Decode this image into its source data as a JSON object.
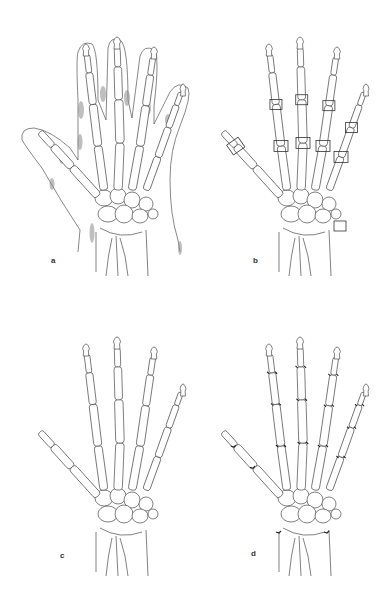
{
  "figure": {
    "panels": [
      {
        "id": "a",
        "label": "a",
        "label_pos": [
          51,
          257
        ],
        "variant": "soft-tissue-outline",
        "description": "Hand skeleton with soft tissue outline and shaded swelling regions"
      },
      {
        "id": "b",
        "label": "b",
        "label_pos": [
          253,
          257
        ],
        "variant": "boxed-joints",
        "description": "Hand skeleton with boxed joint regions (PIP, MCP, thumb IP, ulnar styloid)"
      },
      {
        "id": "c",
        "label": "c",
        "label_pos": [
          60,
          552
        ],
        "variant": "plain",
        "description": "Plain hand skeleton"
      },
      {
        "id": "d",
        "label": "d",
        "label_pos": [
          251,
          550
        ],
        "variant": "erosions",
        "description": "Hand skeleton with marked joint erosions"
      }
    ],
    "colors": {
      "background": "#ffffff",
      "line": "#4a4a4a",
      "shade": "#8a8a8a",
      "label": "#333333"
    }
  }
}
